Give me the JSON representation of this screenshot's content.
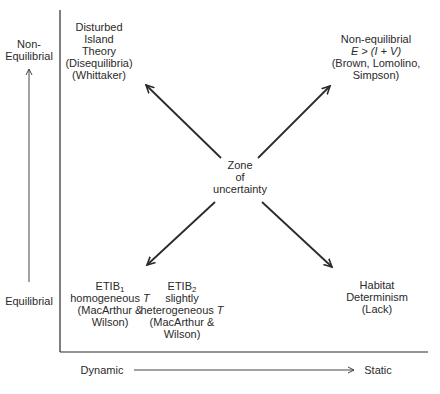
{
  "diagram": {
    "y_axis": {
      "top_label": [
        "Non-",
        "Equilibrial"
      ],
      "bottom_label": "Equilibrial"
    },
    "x_axis": {
      "left_label": "Dynamic",
      "right_label": "Static"
    },
    "center": [
      "Zone",
      "of",
      "uncertainty"
    ],
    "nodes": {
      "top_left": [
        "Disturbed",
        "Island",
        "Theory",
        "(Disequilibria)",
        "(Whittaker)"
      ],
      "top_right": {
        "line1": "Non-equilibrial",
        "line2_italic": "E > (I + V)",
        "line3": "(Brown, Lomolino,",
        "line4": "Simpson)"
      },
      "bottom_left_1": {
        "title": "ETIB",
        "subscript": "1",
        "line2": "homogeneous",
        "line2_italic": "T",
        "line3": "(MacArthur &",
        "line4": "Wilson)"
      },
      "bottom_left_2": {
        "title": "ETIB",
        "subscript": "2",
        "line2": "slightly",
        "line3": "heterogeneous",
        "line3_italic": "T",
        "line4": "(MacArthur &",
        "line5": "Wilson)"
      },
      "bottom_right": [
        "Habitat",
        "Determinism",
        "(Lack)"
      ]
    },
    "colors": {
      "ink": "#2a2a2a",
      "background": "#ffffff"
    }
  }
}
